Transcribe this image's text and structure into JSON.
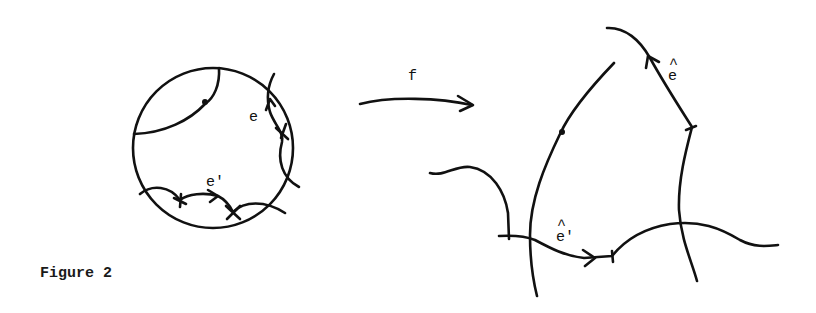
{
  "caption": "Figure 2",
  "map_label": "f",
  "left_figure": {
    "shape": "disk",
    "edge_labels": {
      "e": "e",
      "e_prime": "e'"
    }
  },
  "right_figure": {
    "edge_labels": {
      "e_hat": "e",
      "e_hat_accent": "^",
      "e_hat_prime": "e'",
      "e_hat_prime_accent": "^"
    }
  },
  "colors": {
    "ink": "#111111",
    "background": "#ffffff"
  }
}
